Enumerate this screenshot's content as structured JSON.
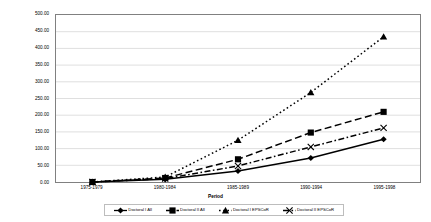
{
  "chart_data": {
    "type": "line",
    "title": "",
    "xlabel": "Period",
    "ylabel": "Percent Change From Initial Period",
    "categories": [
      "1975-1979",
      "1980-1984",
      "1985-1989",
      "1990-1994",
      "1995-1998"
    ],
    "ylim": [
      0,
      500
    ],
    "ytick_step": 50,
    "yticks": [
      "0.00",
      "50.00",
      "100.00",
      "150.00",
      "200.00",
      "250.00",
      "300.00",
      "350.00",
      "400.00",
      "450.00",
      "500.00"
    ],
    "grid": true,
    "legend_position": "bottom",
    "series": [
      {
        "name": "Doctoral I All",
        "marker": "diamond",
        "line_style": "solid",
        "color": "#000000",
        "values": [
          0,
          8,
          33,
          72,
          128
        ]
      },
      {
        "name": "Doctoral II All",
        "marker": "square",
        "line_style": "dashed",
        "color": "#000000",
        "values": [
          0,
          12,
          68,
          148,
          210
        ]
      },
      {
        "name": "Doctoral I EPSCoR",
        "marker": "triangle",
        "line_style": "dotted",
        "color": "#000000",
        "values": [
          0,
          15,
          125,
          268,
          435
        ]
      },
      {
        "name": "Doctoral II EPSCoR",
        "marker": "cross",
        "line_style": "dash-dot",
        "color": "#000000",
        "values": [
          0,
          10,
          48,
          105,
          162
        ]
      }
    ]
  }
}
